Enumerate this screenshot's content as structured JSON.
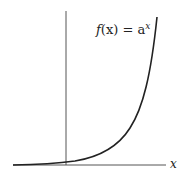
{
  "diagram": {
    "function_label_f": "f",
    "function_label_mid": "(x) = a",
    "function_label_exp": "x",
    "x_axis_label": "x",
    "colors": {
      "axis": "#555555",
      "curve": "#222222",
      "text": "#222222"
    }
  }
}
